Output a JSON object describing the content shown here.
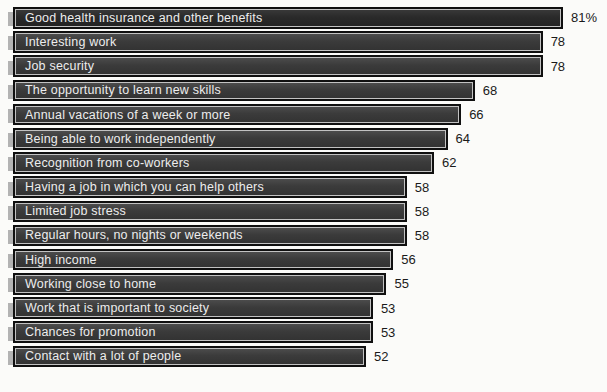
{
  "chart_data": {
    "type": "bar",
    "orientation": "horizontal",
    "title": "",
    "xlabel": "",
    "ylabel": "",
    "xlim": [
      0,
      81
    ],
    "grid": false,
    "legend": false,
    "categories": [
      "Good health insurance and other benefits",
      "Interesting work",
      "Job security",
      "The opportunity to learn new skills",
      "Annual vacations of a week or more",
      "Being able to work independently",
      "Recognition from co-workers",
      "Having a job in which you can help others",
      "Limited job stress",
      "Regular hours, no nights or weekends",
      "High income",
      "Working close to home",
      "Work that is important to society",
      "Chances for promotion",
      "Contact with a lot of people"
    ],
    "values": [
      81,
      78,
      78,
      68,
      66,
      64,
      62,
      58,
      58,
      58,
      56,
      55,
      53,
      53,
      52
    ],
    "value_labels": [
      "81%",
      "78",
      "78",
      "68",
      "66",
      "64",
      "62",
      "58",
      "58",
      "58",
      "56",
      "55",
      "53",
      "53",
      "52"
    ]
  },
  "colors": {
    "background": "#fbfbf9",
    "bar_fill": "#3b3b3b",
    "first_bar_fill": "#2a2a2a",
    "bar_border": "#101010",
    "bar_inner_bevel": "#c2c2c2",
    "endcap": "#b3b3b3",
    "category_text": "#ededed",
    "value_text": "#1a1a1a"
  }
}
